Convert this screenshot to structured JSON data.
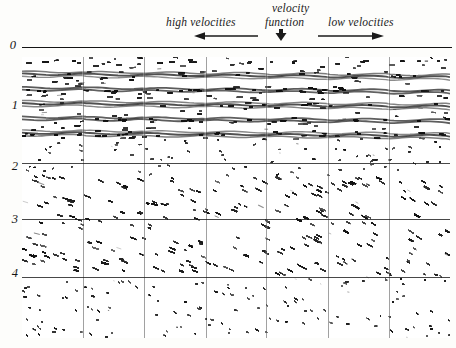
{
  "figure": {
    "background_color": "#fdfdfb",
    "ink_color": "#141414"
  },
  "header": {
    "velocity_word": "velocity",
    "function_word": "function",
    "high_label": "high  velocities",
    "low_label": "low  velocities",
    "arrows": [
      {
        "name": "left-arrow",
        "direction": "left",
        "x": 194,
        "y": 33,
        "length": 62
      },
      {
        "name": "down-arrow",
        "direction": "down",
        "x": 280,
        "y": 30,
        "length": 10
      },
      {
        "name": "right-arrow",
        "direction": "right",
        "x": 318,
        "y": 33,
        "length": 62
      }
    ]
  },
  "axis": {
    "label_unit": "s",
    "ticks": [
      "0",
      "1",
      "2",
      "3",
      "4"
    ],
    "tick_pixel_y": [
      44,
      104,
      165,
      218,
      272
    ],
    "datum_label": "0",
    "datum_line_y": 47
  },
  "panel": {
    "left": 22,
    "top": 57,
    "width": 428,
    "height": 281,
    "sub_panel_count": 7,
    "vertical_divider_fractions": [
      0.143,
      0.286,
      0.429,
      0.571,
      0.714,
      0.857
    ],
    "horizontal_line_fractions": [
      0.378,
      0.576,
      0.784
    ],
    "top_tick_fractions": [
      0.143,
      0.286,
      0.429,
      0.571,
      0.714,
      0.857
    ]
  },
  "chart_data": {
    "type": "heatmap",
    "xlabel": "",
    "ylabel": "",
    "tick_labels_y": [
      "0",
      "1",
      "2",
      "3",
      "4"
    ],
    "ylim": [
      0,
      4.6
    ],
    "grid": true,
    "legend": "none",
    "annotations": [
      "velocity",
      "function",
      "high  velocities",
      "low  velocities"
    ],
    "zones": [
      {
        "name": "flat-reflector-band",
        "time_range": [
          0.05,
          1.35
        ],
        "character": "strong sub-horizontal coherent reflectors",
        "amplitude": 0.95
      },
      {
        "name": "transition-band",
        "time_range": [
          1.35,
          1.95
        ],
        "character": "weak incoherent noise",
        "amplitude": 0.45
      },
      {
        "name": "dipping-event-band",
        "time_range": [
          1.95,
          3.55
        ],
        "character": "steeply dipping cross-cutting events",
        "amplitude": 0.85
      },
      {
        "name": "noise-band",
        "time_range": [
          3.55,
          4.6
        ],
        "character": "low-amplitude random noise",
        "amplitude": 0.4
      }
    ]
  }
}
